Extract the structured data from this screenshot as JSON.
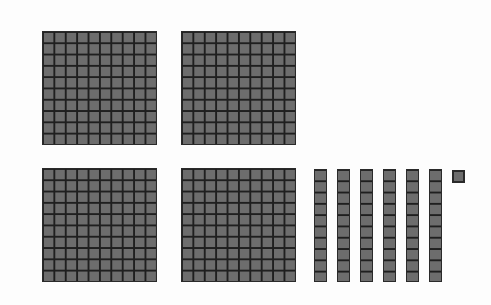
{
  "diagram": {
    "type": "base-ten-blocks",
    "represented_value": 461,
    "colors": {
      "block_fill": "#6d6d6d",
      "grid_line": "#1f1f1f",
      "background": "#ffffff"
    },
    "hundreds": [
      {
        "x": 42,
        "y": 31
      },
      {
        "x": 181,
        "y": 31
      },
      {
        "x": 42,
        "y": 168
      },
      {
        "x": 181,
        "y": 168
      }
    ],
    "tens": [
      {
        "x": 314,
        "y": 169
      },
      {
        "x": 337,
        "y": 169
      },
      {
        "x": 360,
        "y": 169
      },
      {
        "x": 383,
        "y": 169
      },
      {
        "x": 406,
        "y": 169
      },
      {
        "x": 429,
        "y": 169
      }
    ],
    "ones": [
      {
        "x": 452,
        "y": 170
      }
    ],
    "counts": {
      "hundreds": 4,
      "tens": 6,
      "ones": 1
    }
  }
}
